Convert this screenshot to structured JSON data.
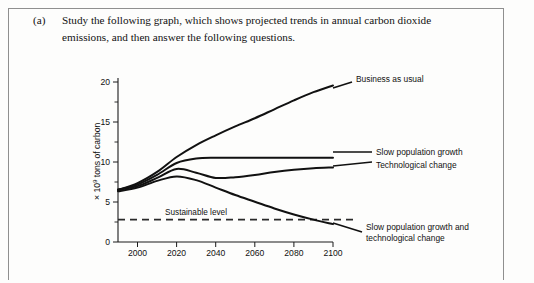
{
  "question": {
    "marker": "(a)",
    "text": "Study the following graph, which shows projected trends in annual carbon dioxide emissions, and then answer the following questions."
  },
  "chart_data": {
    "type": "line",
    "title": "",
    "xlabel": "",
    "ylabel": "× 10⁹ tons of carbon",
    "ylabel_base": "× 10",
    "ylabel_exp": "9",
    "ylabel_tail": " tons of carbon",
    "xlim": [
      1990,
      2100
    ],
    "ylim": [
      0,
      22
    ],
    "grid": false,
    "legend_position": "right-inline-labels",
    "xticks": [
      2000,
      2020,
      2040,
      2060,
      2080,
      2100
    ],
    "xtick_labels": [
      "2000",
      "2020",
      "2040",
      "2060",
      "2080",
      "2100"
    ],
    "yticks": [
      0,
      5,
      10,
      15,
      20
    ],
    "ytick_labels": [
      "0",
      "5",
      "10",
      "15",
      "20"
    ],
    "yticks_minor": [
      2.5,
      7.5,
      12.5,
      17.5
    ],
    "reference_line": {
      "label": "Sustainable level",
      "value": 3,
      "style": "dashed"
    },
    "series": [
      {
        "name": "Business as usual",
        "label": "Business as usual",
        "x": [
          1990,
          2000,
          2010,
          2020,
          2030,
          2040,
          2050,
          2060,
          2070,
          2080,
          2090,
          2100
        ],
        "values": [
          7.0,
          7.9,
          9.4,
          11.4,
          13.0,
          14.3,
          15.5,
          16.6,
          17.8,
          19.0,
          20.1,
          21.0
        ]
      },
      {
        "name": "Slow population growth",
        "label": "Slow population growth",
        "x": [
          1990,
          2000,
          2010,
          2020,
          2030,
          2040,
          2050,
          2060,
          2070,
          2080,
          2090,
          2100
        ],
        "values": [
          7.0,
          7.7,
          9.0,
          10.6,
          11.2,
          11.3,
          11.3,
          11.3,
          11.3,
          11.3,
          11.3,
          11.3
        ]
      },
      {
        "name": "Technological change",
        "label": "Technological change",
        "x": [
          1990,
          2000,
          2010,
          2020,
          2030,
          2040,
          2050,
          2060,
          2070,
          2080,
          2090,
          2100
        ],
        "values": [
          7.0,
          7.5,
          8.6,
          9.8,
          9.3,
          8.6,
          8.7,
          9.0,
          9.4,
          9.7,
          9.9,
          10.0
        ]
      },
      {
        "name": "Slow population growth and technological change",
        "label_line1": "Slow population growth and",
        "label_line2": "technological change",
        "x": [
          1990,
          2000,
          2010,
          2020,
          2030,
          2040,
          2050,
          2060,
          2070,
          2080,
          2090,
          2100
        ],
        "values": [
          6.8,
          7.3,
          8.2,
          8.8,
          8.3,
          7.3,
          6.3,
          5.4,
          4.5,
          3.7,
          3.0,
          2.4
        ]
      }
    ]
  }
}
